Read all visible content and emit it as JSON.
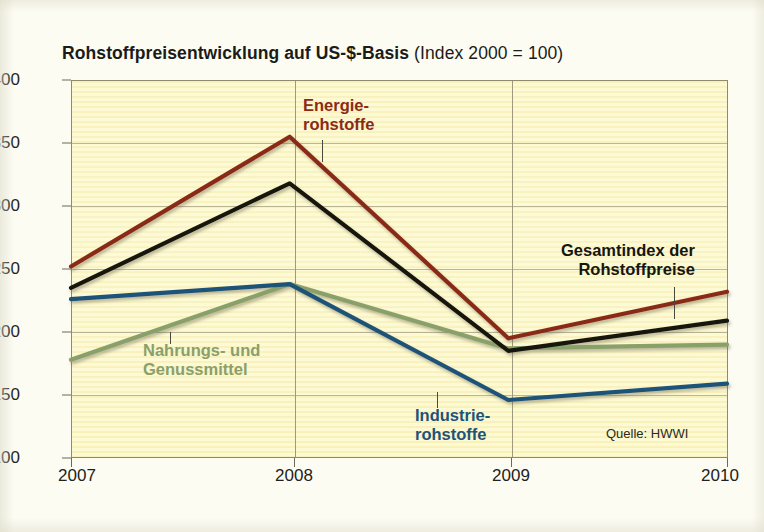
{
  "title": {
    "strong": "Rohstoffpreisentwicklung  auf US-$-Basis",
    "light": " (Index 2000 = 100)"
  },
  "source_note": "Quelle: HWWI",
  "labels": {
    "energie": [
      "Energie-",
      "rohstoffe"
    ],
    "nahrung": [
      "Nahrungs- und",
      "Genussmittel"
    ],
    "industrie": [
      "Industrie-",
      "rohstoffe"
    ],
    "gesamt": [
      "Gesamtindex der",
      "Rohstoffpreise"
    ]
  },
  "colors": {
    "energie": "#8a2b16",
    "gesamt": "#16160f",
    "industrie": "#1d5378",
    "nahrung": "#8aa06a",
    "plot_background": "#fbf6c8",
    "page_background": "#fdfcf3",
    "axis": "#8d8a6e"
  },
  "chart_data": {
    "type": "line",
    "title": "Rohstoffpreisentwicklung auf US-$-Basis (Index 2000 = 100)",
    "subtitle": "",
    "xlabel": "",
    "ylabel": "",
    "x": [
      2007,
      2008,
      2009,
      2010
    ],
    "categories": [
      "2007",
      "2008",
      "2009",
      "2010"
    ],
    "xtick_labels": [
      "2007",
      "2008",
      "2009",
      "2010"
    ],
    "ytick_labels": [
      "400",
      "350",
      "300",
      "250",
      "200",
      "150",
      "100"
    ],
    "yticks": [
      400,
      350,
      300,
      250,
      200,
      150,
      100
    ],
    "xlim": [
      2007,
      2010
    ],
    "ylim": [
      100,
      400
    ],
    "grid": "both",
    "legend": "inline-annotations",
    "annotations": [
      {
        "text": "Quelle: HWWI",
        "position": "bottom-right"
      }
    ],
    "series": [
      {
        "name": "Energierohstoffe",
        "color": "#8a2b16",
        "values": [
          252,
          355,
          195,
          232
        ]
      },
      {
        "name": "Gesamtindex der Rohstoffpreise",
        "color": "#16160f",
        "values": [
          235,
          318,
          185,
          209
        ]
      },
      {
        "name": "Industrierohstoffe",
        "color": "#1d5378",
        "values": [
          226,
          238,
          146,
          159
        ]
      },
      {
        "name": "Nahrungs- und Genussmittel",
        "color": "#8aa06a",
        "values": [
          178,
          238,
          187,
          190
        ]
      }
    ]
  }
}
